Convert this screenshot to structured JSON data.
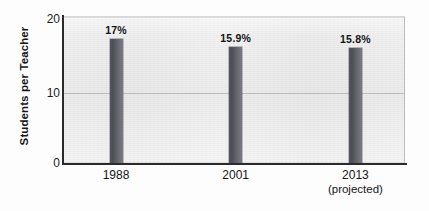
{
  "chart_data": {
    "type": "bar",
    "title": "",
    "xlabel": "",
    "ylabel": "Students per Teacher",
    "categories": [
      "1988",
      "2001",
      "2013"
    ],
    "category_sublabels": [
      "",
      "",
      "(projected)"
    ],
    "values": [
      17,
      15.9,
      15.8
    ],
    "data_labels": [
      "17%",
      "15.9%",
      "15.8%"
    ],
    "ylim": [
      0,
      20
    ],
    "ytick_labels": [
      "0",
      "10",
      "20"
    ],
    "ytick_values": [
      0,
      10,
      20
    ],
    "grid": "horizontal-gridline-at-10",
    "legend": "none",
    "bar_color": "#55555f",
    "plot_background": "#ebebec",
    "axis_color": "#2b2b2b",
    "gridline_color": "#b9b9bb"
  },
  "axis": {
    "y_title": "Students per Teacher",
    "ticks": {
      "t20": "20",
      "t10": "10",
      "t0": "0"
    }
  },
  "bars": [
    {
      "name": "bar-1988",
      "label": "17%",
      "value": 17,
      "category": "1988",
      "sublabel": ""
    },
    {
      "name": "bar-2001",
      "label": "15.9%",
      "value": 15.9,
      "category": "2001",
      "sublabel": ""
    },
    {
      "name": "bar-2013",
      "label": "15.8%",
      "value": 15.8,
      "category": "2013",
      "sublabel": "(projected)"
    }
  ]
}
